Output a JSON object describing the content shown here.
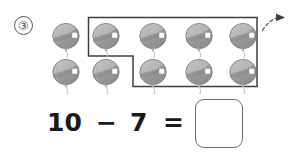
{
  "worksheet": {
    "problem_number": "③",
    "problem_number_value": 3
  },
  "equation": {
    "minuend": "10",
    "operator": "−",
    "subtrahend": "7",
    "equals": "=",
    "answer_value": "",
    "answer_placeholder": ""
  },
  "objects": {
    "icon_name": "balloon-icon",
    "total_count": 10,
    "grouped_count": 7,
    "remaining_count": 3,
    "rows": [
      {
        "row_name": "top-row",
        "count": 5,
        "items": [
          {
            "label": "balloon-1",
            "grouped": false
          },
          {
            "label": "balloon-2",
            "grouped": true
          },
          {
            "label": "balloon-3",
            "grouped": true
          },
          {
            "label": "balloon-4",
            "grouped": true
          },
          {
            "label": "balloon-5",
            "grouped": true
          }
        ]
      },
      {
        "row_name": "bottom-row",
        "count": 5,
        "items": [
          {
            "label": "balloon-6",
            "grouped": false
          },
          {
            "label": "balloon-7",
            "grouped": false
          },
          {
            "label": "balloon-8",
            "grouped": true
          },
          {
            "label": "balloon-9",
            "grouped": true
          },
          {
            "label": "balloon-10",
            "grouped": true
          }
        ]
      }
    ]
  },
  "annotations": {
    "grouping_box_name": "grouping-outline",
    "grouping_box_shape": "L-shaped polygon enclosing 7 balloons",
    "arrow_name": "dashed-take-away-arrow",
    "arrow_style": "dashed curved arrow pointing up-right"
  },
  "colors": {
    "balloon_fill_light": "#b9b9bb",
    "balloon_fill_dark": "#8f8f92",
    "balloon_stroke": "#7c7c7f",
    "balloon_highlight": "#ffffff",
    "balloon_string": "#c3c3c5",
    "outline": "#3f3f41",
    "text": "#19191b",
    "number_circle": "#58585a",
    "answer_box_border": "#6d6d70",
    "background": "#ffffff"
  }
}
